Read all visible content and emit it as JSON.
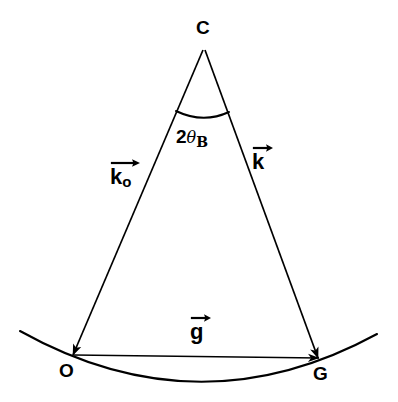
{
  "figure": {
    "kind": "vector-diagram",
    "background_color": "#ffffff",
    "stroke_color": "#000000",
    "width": 398,
    "height": 402
  },
  "points": [
    {
      "id": "C",
      "label": "C",
      "x": 203,
      "y": 47,
      "label_x": 196,
      "label_y": 18
    },
    {
      "id": "O",
      "label": "O",
      "x": 73,
      "y": 355,
      "label_x": 59,
      "label_y": 361
    },
    {
      "id": "G",
      "label": "G",
      "x": 318,
      "y": 358,
      "label_x": 313,
      "label_y": 364
    }
  ],
  "vectors": [
    {
      "id": "k0",
      "name": "incident-wave-vector",
      "symbol": "k",
      "subscript": "o",
      "from": "C",
      "to": "O",
      "label_x": 110,
      "label_y": 158
    },
    {
      "id": "k",
      "name": "diffracted-wave-vector",
      "symbol": "k",
      "subscript": "",
      "from": "C",
      "to": "G",
      "label_x": 252,
      "label_y": 143
    },
    {
      "id": "g",
      "name": "reciprocal-lattice-vector",
      "symbol": "g",
      "subscript": "",
      "from": "O",
      "to": "G",
      "label_x": 190,
      "label_y": 313
    }
  ],
  "angle": {
    "id": "two-theta-b",
    "name": "bragg-angle-2theta",
    "prefix": "2",
    "theta": "θ",
    "subscript": "B",
    "full_text": "2θB",
    "label_x": 176,
    "label_y": 126,
    "vertex": "C",
    "arc_start_x": 176,
    "arc_start_y": 111,
    "arc_end_x": 229,
    "arc_end_y": 112
  },
  "arc": {
    "id": "ewald-sphere-arc",
    "name": "ewald-sphere-surface",
    "start_x": 20,
    "start_y": 331,
    "end_x": 377,
    "end_y": 334,
    "bottom_y": 381,
    "description": "curved surface of reflection passing through O and G"
  }
}
